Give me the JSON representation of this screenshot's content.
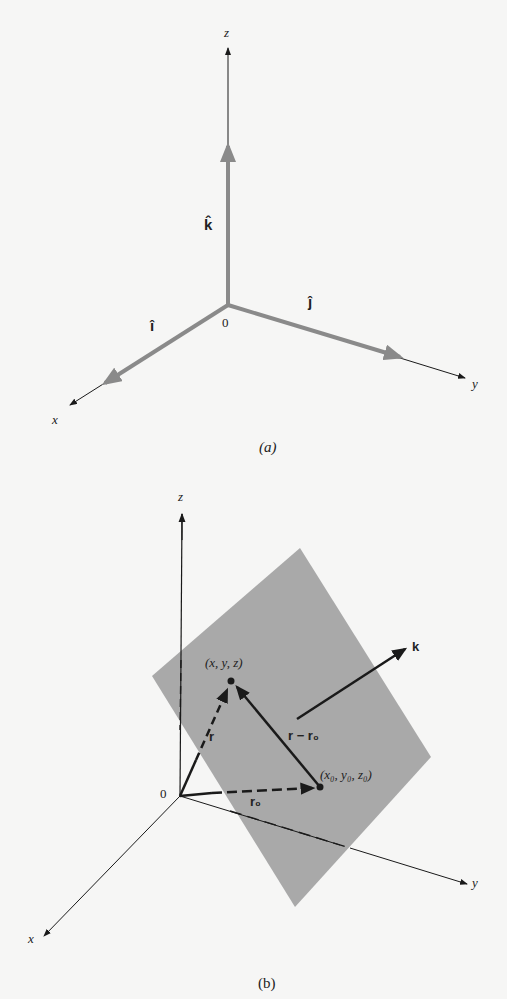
{
  "figure_a": {
    "caption": "(a)",
    "axes": {
      "x": "x",
      "y": "y",
      "z": "z"
    },
    "origin": "0",
    "unit_vectors": {
      "i": "î",
      "j": "ĵ",
      "k": "k̂"
    }
  },
  "figure_b": {
    "caption": "(b)",
    "axes": {
      "x": "x",
      "y": "y",
      "z": "z"
    },
    "origin": "0",
    "point": "(x, y, z)",
    "point0": "(x₀, y₀, z₀)",
    "vector_r": "r",
    "vector_r0": "r₀",
    "vector_diff": "r − r₀",
    "normal": "k"
  },
  "colors": {
    "background": "#f6f6f5",
    "unit_vector": "#8a8a8a",
    "plane": "#a9a9a9",
    "ink": "#1a1a1a"
  }
}
